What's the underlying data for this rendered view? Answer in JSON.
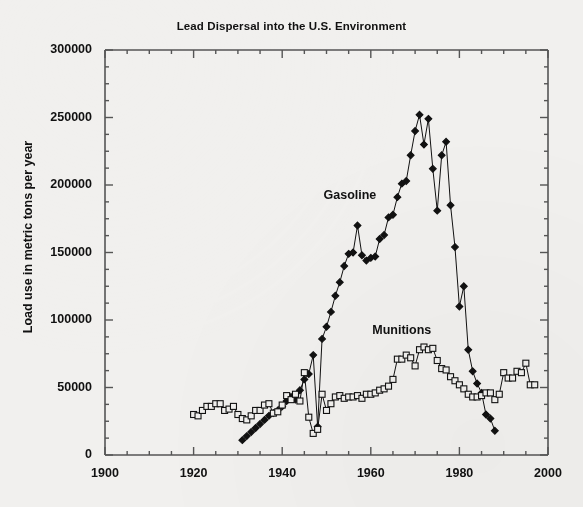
{
  "chart_data": {
    "type": "line",
    "title": "Lead Dispersal into the U.S. Environment",
    "xlabel": "",
    "ylabel": "Load use in metric tons per year",
    "xlim": [
      1900,
      2000
    ],
    "ylim": [
      0,
      300000
    ],
    "x_major_ticks": [
      1900,
      1920,
      1940,
      1960,
      1980,
      2000
    ],
    "x_major_tick_labels": [
      "1900",
      "1920",
      "1940",
      "1960",
      "1980",
      "2000"
    ],
    "x_minor_tick_interval": 5,
    "y_major_ticks": [
      0,
      50000,
      100000,
      150000,
      200000,
      250000,
      300000
    ],
    "y_major_tick_labels": [
      "0",
      "50000",
      "100000",
      "150000",
      "200000",
      "250000",
      "300000"
    ],
    "y_minor_tick_interval": 12500,
    "grid": false,
    "legend_position": "inline-annotations",
    "series": [
      {
        "name": "Gasoline",
        "marker": "filled-diamond",
        "color": "#111111",
        "label_x": 1957,
        "label_y": 192000,
        "points": [
          [
            1931,
            11000
          ],
          [
            1932,
            14000
          ],
          [
            1933,
            17000
          ],
          [
            1934,
            20000
          ],
          [
            1935,
            23000
          ],
          [
            1936,
            26000
          ],
          [
            1937,
            29000
          ],
          [
            1938,
            31000
          ],
          [
            1939,
            33000
          ],
          [
            1940,
            36000
          ],
          [
            1941,
            40000
          ],
          [
            1942,
            43000
          ],
          [
            1943,
            41000
          ],
          [
            1944,
            48000
          ],
          [
            1945,
            56000
          ],
          [
            1946,
            60000
          ],
          [
            1947,
            74000
          ],
          [
            1948,
            21000
          ],
          [
            1949,
            86000
          ],
          [
            1950,
            95000
          ],
          [
            1951,
            106000
          ],
          [
            1952,
            118000
          ],
          [
            1953,
            128000
          ],
          [
            1954,
            140000
          ],
          [
            1955,
            149000
          ],
          [
            1956,
            150000
          ],
          [
            1957,
            170000
          ],
          [
            1958,
            148000
          ],
          [
            1959,
            144000
          ],
          [
            1960,
            146000
          ],
          [
            1961,
            147000
          ],
          [
            1962,
            160000
          ],
          [
            1963,
            163000
          ],
          [
            1964,
            176000
          ],
          [
            1965,
            178000
          ],
          [
            1966,
            191000
          ],
          [
            1967,
            201000
          ],
          [
            1968,
            203000
          ],
          [
            1969,
            222000
          ],
          [
            1970,
            240000
          ],
          [
            1971,
            252000
          ],
          [
            1972,
            230000
          ],
          [
            1973,
            249000
          ],
          [
            1974,
            212000
          ],
          [
            1975,
            181000
          ],
          [
            1976,
            222000
          ],
          [
            1977,
            232000
          ],
          [
            1978,
            185000
          ],
          [
            1979,
            154000
          ],
          [
            1980,
            110000
          ],
          [
            1981,
            125000
          ],
          [
            1982,
            78000
          ],
          [
            1983,
            62000
          ],
          [
            1984,
            53000
          ],
          [
            1985,
            46000
          ],
          [
            1986,
            30000
          ],
          [
            1987,
            27000
          ],
          [
            1988,
            18000
          ]
        ]
      },
      {
        "name": "Munitions",
        "marker": "open-square",
        "color": "#111111",
        "label_x": 1968,
        "label_y": 92000,
        "points": [
          [
            1920,
            30000
          ],
          [
            1921,
            29000
          ],
          [
            1922,
            33000
          ],
          [
            1923,
            36000
          ],
          [
            1924,
            36000
          ],
          [
            1925,
            38000
          ],
          [
            1926,
            38000
          ],
          [
            1927,
            33000
          ],
          [
            1928,
            34000
          ],
          [
            1929,
            36000
          ],
          [
            1930,
            30000
          ],
          [
            1931,
            27000
          ],
          [
            1932,
            26000
          ],
          [
            1933,
            29000
          ],
          [
            1934,
            33000
          ],
          [
            1935,
            33000
          ],
          [
            1936,
            37000
          ],
          [
            1937,
            38000
          ],
          [
            1938,
            31000
          ],
          [
            1939,
            32000
          ],
          [
            1940,
            37000
          ],
          [
            1941,
            44000
          ],
          [
            1942,
            41000
          ],
          [
            1943,
            45000
          ],
          [
            1944,
            40000
          ],
          [
            1945,
            61000
          ],
          [
            1946,
            28000
          ],
          [
            1947,
            16000
          ],
          [
            1948,
            19000
          ],
          [
            1949,
            45000
          ],
          [
            1950,
            33000
          ],
          [
            1951,
            38000
          ],
          [
            1952,
            43000
          ],
          [
            1953,
            44000
          ],
          [
            1954,
            42000
          ],
          [
            1955,
            43000
          ],
          [
            1956,
            43000
          ],
          [
            1957,
            44000
          ],
          [
            1958,
            42000
          ],
          [
            1959,
            45000
          ],
          [
            1960,
            45000
          ],
          [
            1961,
            46000
          ],
          [
            1962,
            48000
          ],
          [
            1963,
            49000
          ],
          [
            1964,
            51000
          ],
          [
            1965,
            56000
          ],
          [
            1966,
            71000
          ],
          [
            1967,
            71000
          ],
          [
            1968,
            74000
          ],
          [
            1969,
            72000
          ],
          [
            1970,
            66000
          ],
          [
            1971,
            78000
          ],
          [
            1972,
            80000
          ],
          [
            1973,
            78000
          ],
          [
            1974,
            79000
          ],
          [
            1975,
            70000
          ],
          [
            1976,
            64000
          ],
          [
            1977,
            63000
          ],
          [
            1978,
            58000
          ],
          [
            1979,
            55000
          ],
          [
            1980,
            52000
          ],
          [
            1981,
            49000
          ],
          [
            1982,
            45000
          ],
          [
            1983,
            43000
          ],
          [
            1984,
            43000
          ],
          [
            1985,
            44000
          ],
          [
            1986,
            46000
          ],
          [
            1987,
            46000
          ],
          [
            1988,
            41000
          ],
          [
            1989,
            45000
          ],
          [
            1990,
            61000
          ],
          [
            1991,
            57000
          ],
          [
            1992,
            57000
          ],
          [
            1993,
            62000
          ],
          [
            1994,
            61000
          ],
          [
            1995,
            68000
          ],
          [
            1996,
            52000
          ],
          [
            1997,
            52000
          ]
        ]
      }
    ]
  },
  "style": {
    "background": "#f1f0ee",
    "axis_color": "#555555",
    "ink": "#111111"
  }
}
